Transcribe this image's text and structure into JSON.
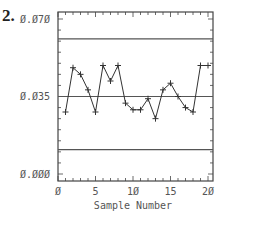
{
  "figure_number": "2.",
  "chart_data": {
    "type": "line",
    "title": "",
    "xlabel": "Sample Number",
    "ylabel": "",
    "xlim": [
      0,
      20
    ],
    "ylim": [
      0.0,
      0.07
    ],
    "x_ticks": [
      "0",
      "5",
      "10",
      "15",
      "20"
    ],
    "x_tick_display": [
      "Ø",
      "5",
      "1Ø",
      "15",
      "2Ø"
    ],
    "y_ticks": [
      "0.000",
      "0.035",
      "0.070"
    ],
    "y_tick_display": [
      "Ø.ØØØ",
      "Ø.Ø35",
      "Ø.Ø7Ø"
    ],
    "grid": false,
    "legend": null,
    "x": [
      1,
      2,
      3,
      4,
      5,
      6,
      7,
      8,
      9,
      10,
      11,
      12,
      13,
      14,
      15,
      16,
      17,
      18,
      19,
      20
    ],
    "series": [
      {
        "name": "sample",
        "marker": "+",
        "values": [
          0.028,
          0.048,
          0.045,
          0.038,
          0.028,
          0.049,
          0.042,
          0.049,
          0.032,
          0.029,
          0.029,
          0.034,
          0.025,
          0.038,
          0.041,
          0.035,
          0.03,
          0.028,
          0.049,
          0.049
        ]
      }
    ],
    "reference_lines": [
      {
        "name": "UCL",
        "y": 0.061
      },
      {
        "name": "CL",
        "y": 0.035
      },
      {
        "name": "LCL",
        "y": 0.011
      }
    ]
  },
  "colors": {
    "line": "#333333",
    "frame": "#444444",
    "text": "#555555"
  }
}
